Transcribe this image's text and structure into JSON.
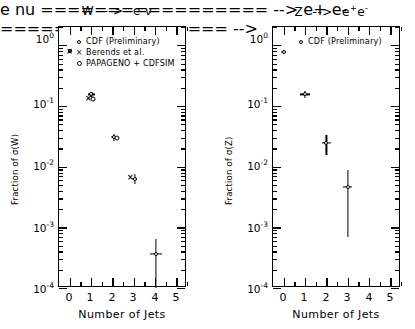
{
  "chart_data": [
    {
      "type": "scatter",
      "panel": "left",
      "title": "W --> e ν",
      "title_parts": {
        "boson": "W",
        "arrow": "-->",
        "decay": "e ν"
      },
      "xlabel": "Number of Jets",
      "ylabel": "Fraction of σ(W)",
      "xlim": [
        -0.5,
        5.5
      ],
      "ylim": [
        0.0001,
        2.0
      ],
      "yscale": "log",
      "xticks": [
        0,
        1,
        2,
        3,
        4,
        5
      ],
      "xticklabels": [
        "0",
        "1",
        "2",
        "3",
        "4",
        "5"
      ],
      "yticks": [
        1,
        0.1,
        0.01,
        0.001,
        0.0001
      ],
      "yticklabels": [
        "10⁰",
        "10⁻¹",
        "10⁻²",
        "10⁻³",
        "10⁻⁴"
      ],
      "grid": false,
      "legend_position": "upper-center",
      "series": [
        {
          "name": "CDF (Preliminary)",
          "marker": "open-circle",
          "points": [
            {
              "x": 0.0,
              "y": 0.8,
              "xerr": 0.1,
              "yerr": 0.05
            },
            {
              "x": 1.02,
              "y": 0.155,
              "xerr": 0.16,
              "yerr": 0.012
            },
            {
              "x": 2.08,
              "y": 0.0305,
              "xerr": 0.14,
              "yerr": 0.004
            },
            {
              "x": 3.05,
              "y": 0.0063,
              "xerr": 0.12,
              "yerr": 0.0012
            },
            {
              "x": 4.05,
              "y": 0.00037,
              "xerr": 0.3,
              "yerr": 0.00028
            }
          ]
        },
        {
          "name": "Berends et al.",
          "marker": "cross-x",
          "points": [
            {
              "x": 0.0,
              "y": 0.8
            },
            {
              "x": 0.88,
              "y": 0.137
            },
            {
              "x": 2.85,
              "y": 0.0068
            }
          ]
        },
        {
          "name": "PAPAGENO + CDFSIM",
          "marker": "open-circle-large",
          "points": [
            {
              "x": 1.1,
              "y": 0.128
            },
            {
              "x": 2.22,
              "y": 0.03
            }
          ]
        }
      ]
    },
    {
      "type": "scatter",
      "panel": "right",
      "title": "Z --> e+e-",
      "title_parts": {
        "boson": "Z",
        "arrow": "-->",
        "decay": "e",
        "sup1": "+",
        "decay2": "e",
        "sup2": "-"
      },
      "xlabel": "Number of Jets",
      "ylabel": "Fraction of σ(Z)",
      "xlim": [
        -0.5,
        5.5
      ],
      "ylim": [
        0.0001,
        2.0
      ],
      "yscale": "log",
      "xticks": [
        0,
        1,
        2,
        3,
        4,
        5
      ],
      "xticklabels": [
        "0",
        "1",
        "2",
        "3",
        "4",
        "5"
      ],
      "yticks": [
        1,
        0.1,
        0.01,
        0.001,
        0.0001
      ],
      "yticklabels": [
        "10⁰",
        "10⁻¹",
        "10⁻²",
        "10⁻³",
        "10⁻⁴"
      ],
      "grid": false,
      "legend_position": "upper-center",
      "series": [
        {
          "name": "CDF (Preliminary)",
          "marker": "open-circle",
          "points": [
            {
              "x": 0.0,
              "y": 0.78,
              "xerr": 0.13,
              "yerr": 0.05
            },
            {
              "x": 1.0,
              "y": 0.155,
              "xerr": 0.22,
              "yerr": 0.022
            },
            {
              "x": 2.0,
              "y": 0.0245,
              "xerr": 0.22,
              "yerr": 0.009
            },
            {
              "x": 3.0,
              "y": 0.0047,
              "xerr": 0.22,
              "yerr": 0.004
            }
          ]
        }
      ]
    }
  ],
  "panels": {
    "left": {
      "title": "W --> e ν",
      "title_boson": "W",
      "title_arrow": "-->",
      "title_decay": "e ν",
      "ytitle": "Fraction of σ(W)",
      "xtitle": "Number of Jets",
      "yticklabels": [
        "10",
        "10",
        "10",
        "10",
        "10"
      ],
      "yticksups": [
        "0",
        "-1",
        "-2",
        "-3",
        "-4"
      ],
      "xticklabels": [
        "0",
        "1",
        "2",
        "3",
        "4",
        "5"
      ],
      "legend": [
        {
          "symbol": "open-circle",
          "label": "CDF (Preliminary)"
        },
        {
          "symbol": "cross-x",
          "label": "Berends et al."
        },
        {
          "symbol": "open-circle-large",
          "label": "PAPAGENO + CDFSIM"
        }
      ]
    },
    "right": {
      "title": "Z --> e+e-",
      "title_boson": "Z",
      "title_arrow": "-->",
      "title_e1": "e",
      "title_sup1": "+",
      "title_e2": "e",
      "title_sup2": "-",
      "ytitle": "Fraction of σ(Z)",
      "xtitle": "Number of Jets",
      "yticklabels": [
        "10",
        "10",
        "10",
        "10",
        "10"
      ],
      "yticksups": [
        "0",
        "-1",
        "-2",
        "-3",
        "-4"
      ],
      "xticklabels": [
        "0",
        "1",
        "2",
        "3",
        "4",
        "5"
      ],
      "legend": [
        {
          "symbol": "open-circle",
          "label": "CDF (Preliminary)"
        }
      ]
    }
  }
}
